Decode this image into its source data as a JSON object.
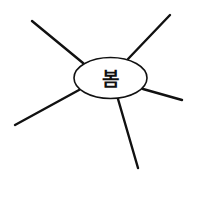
{
  "diagram": {
    "type": "mind-map",
    "center": {
      "label": "봄",
      "cx": 110.5,
      "cy": 78,
      "rx": 36.5,
      "ry": 20.5
    },
    "branches": [
      {
        "id": "top-left",
        "x1": 32,
        "y1": 21,
        "x2": 83,
        "y2": 63
      },
      {
        "id": "top-right",
        "x1": 170,
        "y1": 15,
        "x2": 128,
        "y2": 59
      },
      {
        "id": "right",
        "x1": 143,
        "y1": 89,
        "x2": 182,
        "y2": 100
      },
      {
        "id": "lower-left",
        "x1": 79,
        "y1": 90,
        "x2": 15,
        "y2": 125
      },
      {
        "id": "bottom",
        "x1": 118,
        "y1": 99,
        "x2": 138,
        "y2": 168
      }
    ],
    "colors": {
      "line": "#111111",
      "background": "#ffffff",
      "node_fill": "#ffffff"
    }
  }
}
